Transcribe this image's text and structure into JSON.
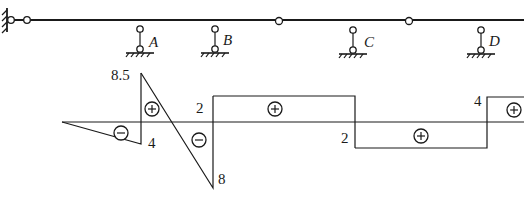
{
  "structure": {
    "supports": [
      {
        "label": "A"
      },
      {
        "label": "B"
      },
      {
        "label": "C"
      },
      {
        "label": "D"
      }
    ]
  },
  "diagram": {
    "type": "shear-force diagram",
    "values": {
      "peak_positive_AB": "8.5",
      "left_of_A": "4",
      "at_B_right": "2",
      "at_B_left": "8",
      "at_C": "2",
      "at_D": "4"
    },
    "signs": {
      "left_span": "−",
      "A_right_upper": "+",
      "AB_lower": "−",
      "BC": "+",
      "CD": "+",
      "D_right": "+"
    }
  }
}
